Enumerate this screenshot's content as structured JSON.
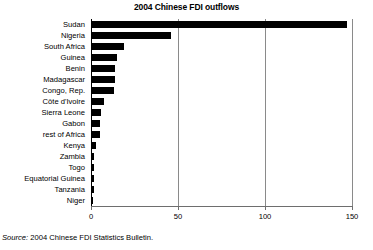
{
  "chart_data": {
    "type": "bar",
    "orientation": "horizontal",
    "title": "2004 Chinese FDI outflows",
    "xlabel": "",
    "ylabel": "",
    "xlim": [
      0,
      150
    ],
    "xticks": [
      "0",
      "50",
      "100",
      "150"
    ],
    "xtick_values": [
      0,
      50,
      100,
      150
    ],
    "grid": true,
    "grid_axis": "x",
    "legend": false,
    "bar_color": "#000000",
    "categories": [
      "Sudan",
      "Nigeria",
      "South Africa",
      "Guinea",
      "Benin",
      "Madagascar",
      "Congo, Rep.",
      "Côte d'Ivoire",
      "Sierra Leone",
      "Gabon",
      "rest of Africa",
      "Kenya",
      "Zambia",
      "Togo",
      "Equatorial Guinea",
      "Tanzania",
      "Niger"
    ],
    "values": [
      147,
      46,
      19,
      15,
      14,
      14,
      13,
      7.5,
      6,
      5,
      5,
      3,
      1.8,
      1.5,
      1.5,
      1.5,
      1.2
    ]
  },
  "source": {
    "label": "Source:",
    "text": "2004 Chinese FDI Statistics Bulletin."
  }
}
